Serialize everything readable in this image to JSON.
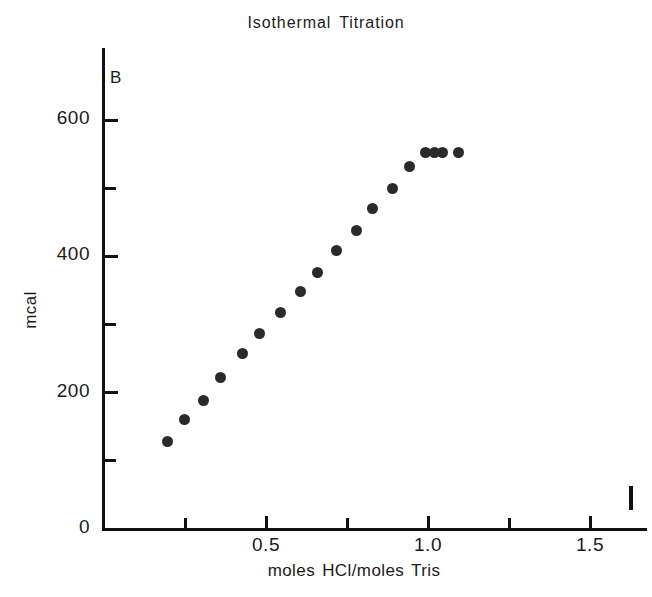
{
  "chart_data": {
    "type": "scatter",
    "title": "Isothermal Titration",
    "panel_label": "B",
    "xlabel": "moles HCl/moles Tris",
    "ylabel": "mcal",
    "xlim": [
      0,
      1.677
    ],
    "ylim": [
      0,
      675
    ],
    "grid": false,
    "legend": null,
    "x_major_ticks": [
      0.5,
      1.0,
      1.5
    ],
    "x_major_tick_labels": [
      "0.5",
      "1.0",
      "1.5"
    ],
    "x_minor_ticks": [
      0.25,
      0.75,
      1.25
    ],
    "y_major_ticks": [
      0,
      200,
      400,
      600
    ],
    "y_major_tick_labels": [
      "0",
      "200",
      "400",
      "600"
    ],
    "y_minor_ticks": [
      100,
      300,
      500
    ],
    "marker": "filled-circle",
    "marker_color": "#2a2a2a",
    "series": [
      {
        "name": "Isothermal titration of Tris with HCl",
        "x": [
          0.197,
          0.247,
          0.306,
          0.361,
          0.426,
          0.481,
          0.546,
          0.605,
          0.66,
          0.719,
          0.778,
          0.83,
          0.889,
          0.944,
          0.991,
          1.019,
          1.046,
          1.093
        ],
        "y": [
          129,
          160,
          189,
          222,
          257,
          287,
          317,
          348,
          377,
          408,
          438,
          470,
          500,
          532,
          552,
          552,
          552,
          552
        ]
      }
    ]
  },
  "colors": {
    "ink": "#111111",
    "text": "#1a1a1a",
    "marker": "#2a2a2a",
    "background": "#ffffff"
  }
}
